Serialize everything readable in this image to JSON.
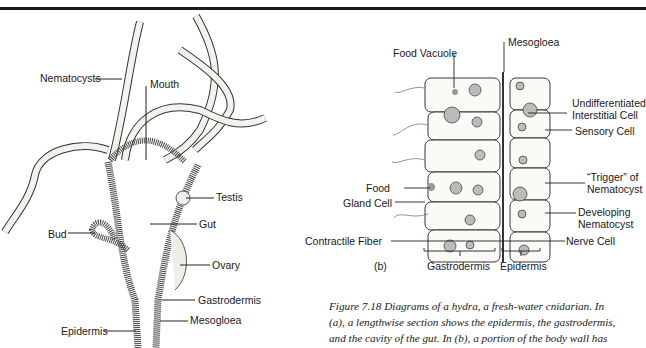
{
  "figure_a": {
    "labels": {
      "nematocysts": "Nematocysts",
      "mouth": "Mouth",
      "testis": "Testis",
      "gut": "Gut",
      "bud": "Bud",
      "ovary": "Ovary",
      "gastrodermis": "Gastrodermis",
      "epidermis": "Epidermis",
      "mesogloea": "Mesogloea"
    }
  },
  "figure_b": {
    "panel_label": "(b)",
    "labels": {
      "food_vacuole": "Food Vacuole",
      "mesogloea": "Mesogloea",
      "undifferentiated_1": "Undifferentiated",
      "undifferentiated_2": "Interstitial Cell",
      "sensory_cell": "Sensory Cell",
      "food": "Food",
      "trigger_1": "“Trigger” of",
      "trigger_2": "Nematocyst",
      "gland_cell": "Gland Cell",
      "developing_1": "Developing",
      "developing_2": "Nematocyst",
      "contractile_fiber": "Contractile Fiber",
      "nerve_cell": "Nerve Cell",
      "gastrodermis": "Gastrodermis",
      "epidermis": "Epidermis"
    }
  },
  "caption": {
    "line1": "Figure 7.18   Diagrams of a hydra, a fresh-water cnidarian. In",
    "line2": "(a), a lengthwise section shows the epidermis, the gastrodermis,",
    "line3": "and the cavity of the gut. In (b), a portion of the body wall has"
  }
}
